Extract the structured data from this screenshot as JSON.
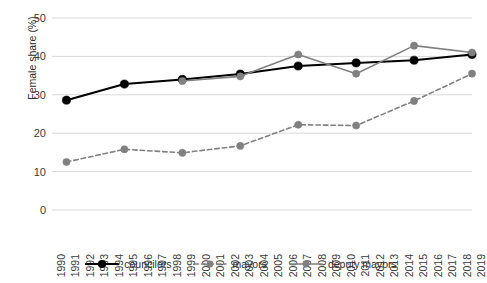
{
  "chart_data": {
    "type": "line",
    "title": "",
    "xlabel": "",
    "ylabel": "Female share (%)",
    "ylim": [
      0,
      50
    ],
    "yticks": [
      0,
      10,
      20,
      30,
      40,
      50
    ],
    "grid": true,
    "legend_position": "bottom",
    "x": [
      1990,
      1991,
      1992,
      1993,
      1994,
      1995,
      1996,
      1997,
      1998,
      1999,
      2000,
      2001,
      2002,
      2003,
      2004,
      2005,
      2006,
      2007,
      2008,
      2009,
      2010,
      2011,
      2012,
      2013,
      2014,
      2015,
      2016,
      2017,
      2018,
      2019
    ],
    "xticklabels": [
      "1990",
      "1991",
      "1992",
      "1993",
      "1994",
      "1995",
      "1996",
      "1997",
      "1998",
      "1999",
      "2000",
      "2001",
      "2002",
      "2003",
      "2004",
      "2005",
      "2006",
      "2007",
      "2008",
      "2009",
      "2010",
      "2011",
      "2012",
      "2013",
      "2014",
      "2015",
      "2016",
      "2017",
      "2018",
      "2019"
    ],
    "series": [
      {
        "name": "councilors",
        "color": "#000000",
        "style": "solid",
        "marker": "circle",
        "points": [
          {
            "x": 1991,
            "y": 28.6
          },
          {
            "x": 1995,
            "y": 32.8
          },
          {
            "x": 1999,
            "y": 34.0
          },
          {
            "x": 2003,
            "y": 35.4
          },
          {
            "x": 2007,
            "y": 37.5
          },
          {
            "x": 2011,
            "y": 38.3
          },
          {
            "x": 2015,
            "y": 39.0
          },
          {
            "x": 2019,
            "y": 40.5
          }
        ]
      },
      {
        "name": "mayors",
        "color": "#808080",
        "style": "dashed",
        "marker": "circle",
        "points": [
          {
            "x": 1991,
            "y": 12.5
          },
          {
            "x": 1995,
            "y": 15.8
          },
          {
            "x": 1999,
            "y": 14.9
          },
          {
            "x": 2003,
            "y": 16.7
          },
          {
            "x": 2007,
            "y": 22.2
          },
          {
            "x": 2011,
            "y": 22.0
          },
          {
            "x": 2015,
            "y": 28.4
          },
          {
            "x": 2019,
            "y": 35.5
          }
        ]
      },
      {
        "name": "deputy mayors",
        "color": "#808080",
        "style": "solid",
        "marker": "circle",
        "points": [
          {
            "x": 1999,
            "y": 33.6
          },
          {
            "x": 2003,
            "y": 34.8
          },
          {
            "x": 2007,
            "y": 40.5
          },
          {
            "x": 2011,
            "y": 35.5
          },
          {
            "x": 2015,
            "y": 42.8
          },
          {
            "x": 2019,
            "y": 41.0
          }
        ]
      }
    ]
  },
  "legend": {
    "items": [
      {
        "label": "councilors"
      },
      {
        "label": "mayors"
      },
      {
        "label": "deputy mayors"
      }
    ]
  },
  "axis": {
    "y_title": "Female share (%)"
  }
}
